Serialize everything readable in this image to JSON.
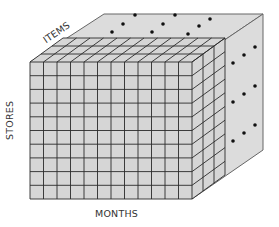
{
  "diagram": {
    "type": "olap-data-cube",
    "axes": {
      "depth_label": "ITEMS",
      "vertical_label": "STORES",
      "horizontal_label": "MONTHS"
    },
    "front_grid": {
      "columns": 12,
      "rows": 10
    },
    "slab_depth_cells": 3,
    "ellipsis_dots": {
      "top_face_count": 9,
      "right_face_count": 9
    },
    "colors": {
      "face_fill": "#d6d6d6",
      "grid_line": "#2a2a2a",
      "outline": "#555555",
      "dot": "#111111",
      "label_text": "#333333"
    }
  }
}
